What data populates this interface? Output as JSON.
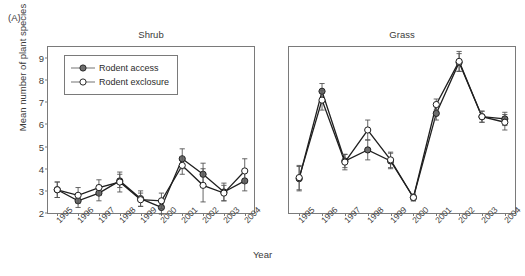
{
  "figure": {
    "panel_label": "(A)",
    "xlabel": "Year",
    "ylabel": "Mean number of plant species"
  },
  "legend": {
    "items": [
      {
        "label": "Rodent access",
        "marker": "filled-circle",
        "color": "#6e6e6e"
      },
      {
        "label": "Rodent exclosure",
        "marker": "open-circle",
        "color": "#ffffff"
      }
    ]
  },
  "axis": {
    "yticks": [
      2,
      3,
      4,
      5,
      6,
      7,
      8,
      9
    ],
    "ylim": [
      2,
      9.5
    ],
    "xticks": [
      "1995",
      "1996",
      "1997",
      "1998",
      "1999",
      "2000",
      "2001",
      "2002",
      "2003",
      "2004"
    ]
  },
  "chart_data": [
    {
      "type": "line",
      "title": "Shrub",
      "xlabel": "Year",
      "ylabel": "Mean number of plant species",
      "ylim": [
        2,
        9.5
      ],
      "grid": false,
      "legend_position": "upper-left",
      "categories": [
        "1995",
        "1996",
        "1997",
        "1998",
        "1999",
        "2000",
        "2001",
        "2002",
        "2003",
        "2004"
      ],
      "series": [
        {
          "name": "Rodent access",
          "values": [
            3.05,
            2.55,
            2.9,
            3.45,
            2.65,
            2.25,
            4.45,
            3.75,
            2.95,
            3.45
          ],
          "errors": [
            0.35,
            0.3,
            0.35,
            0.3,
            0.35,
            0.3,
            0.45,
            0.5,
            0.4,
            0.45
          ]
        },
        {
          "name": "Rodent exclosure",
          "values": [
            3.05,
            2.8,
            3.15,
            3.4,
            2.6,
            2.55,
            4.15,
            3.25,
            2.9,
            3.9
          ],
          "errors": [
            0.35,
            0.35,
            0.35,
            0.45,
            0.3,
            0.35,
            0.4,
            0.75,
            0.35,
            0.55
          ]
        }
      ]
    },
    {
      "type": "line",
      "title": "Grass",
      "xlabel": "Year",
      "ylabel": "Mean number of plant species",
      "ylim": [
        2,
        9.5
      ],
      "grid": false,
      "categories": [
        "1995",
        "1996",
        "1997",
        "1998",
        "1999",
        "2000",
        "2001",
        "2002",
        "2003",
        "2004"
      ],
      "series": [
        {
          "name": "Rodent access",
          "values": [
            3.55,
            7.5,
            4.35,
            4.85,
            4.35,
            2.7,
            6.5,
            8.8,
            6.35,
            6.25
          ],
          "errors": [
            0.55,
            0.35,
            0.3,
            0.45,
            0.35,
            0.15,
            0.3,
            0.4,
            0.25,
            0.3
          ]
        },
        {
          "name": "Rodent exclosure",
          "values": [
            3.6,
            7.1,
            4.3,
            5.75,
            4.4,
            2.7,
            6.9,
            8.85,
            6.35,
            6.1
          ],
          "errors": [
            0.55,
            0.45,
            0.35,
            0.45,
            0.35,
            0.15,
            0.25,
            0.45,
            0.25,
            0.35
          ]
        }
      ]
    }
  ]
}
